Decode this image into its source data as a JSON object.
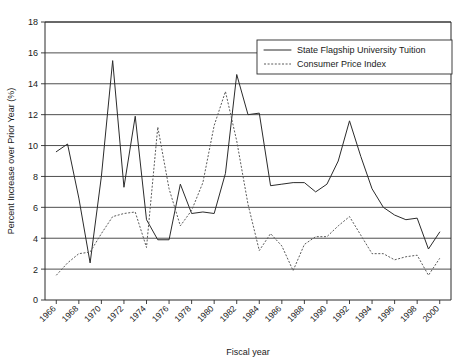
{
  "chart_data": {
    "type": "line",
    "title": "",
    "xlabel": "Fiscal year",
    "ylabel": "Percent Increase over Prior Year (%)",
    "xlim": [
      1965,
      2001
    ],
    "ylim": [
      0,
      18
    ],
    "ytick_step": 2,
    "yticks": [
      0,
      2,
      4,
      6,
      8,
      10,
      12,
      14,
      16,
      18
    ],
    "xticks": [
      1966,
      1968,
      1970,
      1972,
      1974,
      1976,
      1978,
      1980,
      1982,
      1984,
      1986,
      1988,
      1990,
      1992,
      1994,
      1996,
      1998,
      2000
    ],
    "xtick_labels": [
      "1966",
      "1968",
      "1970",
      "1972",
      "1974",
      "1976",
      "1978",
      "1980",
      "1982",
      "1984",
      "1986",
      "1988",
      "1990",
      "1992",
      "1994",
      "1996",
      "1998",
      "2000"
    ],
    "ytick_labels": [
      "0",
      "2",
      "4",
      "6",
      "8",
      "10",
      "12",
      "14",
      "16",
      "18"
    ],
    "grid": "horizontal",
    "legend_position": "top-right",
    "x": [
      1966,
      1967,
      1968,
      1969,
      1970,
      1971,
      1972,
      1973,
      1974,
      1975,
      1976,
      1977,
      1978,
      1979,
      1980,
      1981,
      1982,
      1983,
      1984,
      1985,
      1986,
      1987,
      1988,
      1989,
      1990,
      1991,
      1992,
      1993,
      1994,
      1995,
      1996,
      1997,
      1998,
      1999,
      2000
    ],
    "series": [
      {
        "name": "State Flagship University Tuition",
        "style": "solid",
        "color": "#2b2b2b",
        "values": [
          9.6,
          10.1,
          6.6,
          2.4,
          8.0,
          15.5,
          7.3,
          11.9,
          5.2,
          3.9,
          3.9,
          7.5,
          5.6,
          5.7,
          5.6,
          8.2,
          14.6,
          12.0,
          12.1,
          7.4,
          7.5,
          7.6,
          7.6,
          7.0,
          7.5,
          9.0,
          11.6,
          9.3,
          7.2,
          6.0,
          5.5,
          5.2,
          5.3,
          3.3,
          4.4
        ]
      },
      {
        "name": "Consumer Price Index",
        "style": "dotted",
        "color": "#5a5a5a",
        "values": [
          1.6,
          2.4,
          3.0,
          3.1,
          4.3,
          5.4,
          5.6,
          5.7,
          3.4,
          11.2,
          7.2,
          4.8,
          5.8,
          7.6,
          11.3,
          13.5,
          10.3,
          6.2,
          3.2,
          4.3,
          3.5,
          1.9,
          3.6,
          4.1,
          4.1,
          4.8,
          5.4,
          4.2,
          3.0,
          3.0,
          2.6,
          2.8,
          2.9,
          1.6,
          2.7
        ]
      }
    ]
  },
  "legend": {
    "entries": [
      {
        "label": "State Flagship University Tuition"
      },
      {
        "label": "Consumer Price Index"
      }
    ]
  }
}
